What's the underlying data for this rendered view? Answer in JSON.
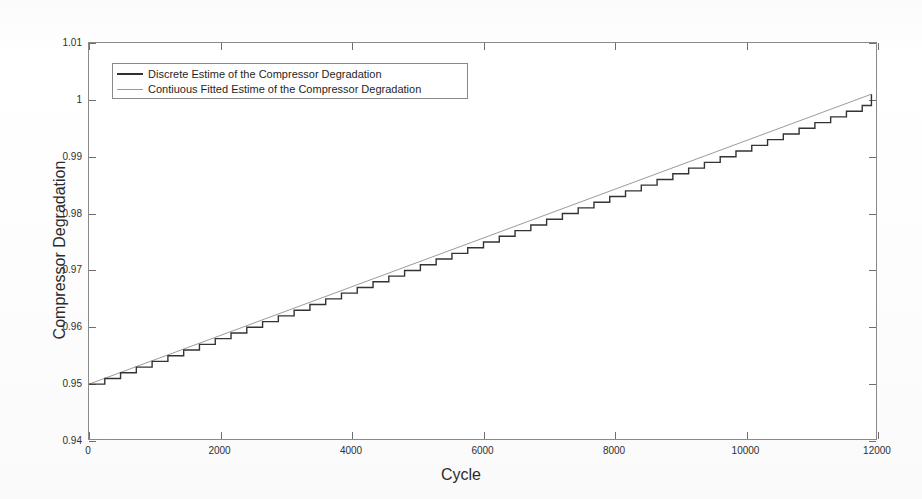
{
  "chart_data": {
    "type": "line",
    "title": "",
    "xlabel": "Cycle",
    "ylabel": "Compressor Degradation",
    "xlim": [
      0,
      12000
    ],
    "ylim": [
      0.94,
      1.01
    ],
    "grid": false,
    "legend_position": "upper-left-inside",
    "x_ticks": [
      0,
      2000,
      4000,
      6000,
      8000,
      10000,
      12000
    ],
    "x_tick_labels": [
      "0",
      "2000",
      "4000",
      "6000",
      "8000",
      "10000",
      "12000"
    ],
    "y_ticks": [
      0.94,
      0.95,
      0.96,
      0.97,
      0.98,
      0.99,
      1.0,
      1.01
    ],
    "y_tick_labels": [
      "0.94",
      "0.95",
      "0.96",
      "0.97",
      "0.98",
      "0.99",
      "1",
      "1.01"
    ],
    "series": [
      {
        "name": "Discrete Estime of the Compressor Degradation",
        "style": "stairs",
        "color": "#303030",
        "x": [
          0,
          240,
          480,
          720,
          960,
          1200,
          1440,
          1680,
          1920,
          2160,
          2400,
          2640,
          2880,
          3120,
          3360,
          3600,
          3840,
          4080,
          4320,
          4560,
          4800,
          5040,
          5280,
          5520,
          5760,
          6000,
          6240,
          6480,
          6720,
          6960,
          7200,
          7440,
          7680,
          7920,
          8160,
          8400,
          8640,
          8880,
          9120,
          9360,
          9600,
          9840,
          10080,
          10320,
          10560,
          10800,
          11040,
          11280,
          11520,
          11760,
          11900
        ],
        "y": [
          0.95,
          0.951,
          0.952,
          0.953,
          0.954,
          0.955,
          0.956,
          0.957,
          0.958,
          0.959,
          0.96,
          0.961,
          0.962,
          0.963,
          0.964,
          0.965,
          0.966,
          0.967,
          0.968,
          0.969,
          0.97,
          0.971,
          0.972,
          0.973,
          0.974,
          0.975,
          0.976,
          0.977,
          0.978,
          0.979,
          0.98,
          0.981,
          0.982,
          0.983,
          0.984,
          0.985,
          0.986,
          0.987,
          0.988,
          0.989,
          0.99,
          0.991,
          0.992,
          0.993,
          0.994,
          0.995,
          0.996,
          0.997,
          0.998,
          0.999,
          1.001
        ]
      },
      {
        "name": "Contiuous Fitted Estime of the Compressor Degradation",
        "style": "line",
        "color": "#8f8f8f",
        "x": [
          0,
          11900
        ],
        "y": [
          0.95,
          1.001
        ]
      }
    ]
  },
  "legend": {
    "entries": [
      {
        "label": "Discrete Estime of the Compressor Degradation",
        "swatch": "solid-dark"
      },
      {
        "label": "Contiuous Fitted Estime of the Compressor Degradation",
        "swatch": "solid-light"
      }
    ]
  },
  "axes": {
    "x_title": "Cycle",
    "y_title": "Compressor Degradation"
  }
}
